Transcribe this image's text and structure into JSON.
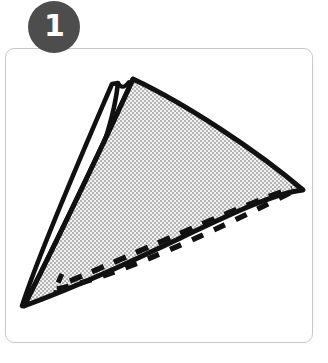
{
  "figure": {
    "kind": "instructional-step-diagram",
    "caption": ""
  },
  "badge": {
    "name": "step-number-badge",
    "number": "1",
    "shape": "circle",
    "fill_color": "#4d4d4d",
    "text_color": "#ffffff"
  },
  "panel": {
    "name": "instruction-panel",
    "background_color": "#ffffff",
    "border_color": "#c9c9c9",
    "corner_radius": 9
  },
  "illustration": {
    "name": "folded-fabric-triangle",
    "outline_color": "#111111",
    "fabric_fill_color": "#cfcfcf",
    "fabric_weave_color": "#bdbdbd",
    "underlayer_color": "#ffffff",
    "stitch_line_color": "#111111",
    "stitch_style": "dashed",
    "elements": [
      {
        "label": "main-fabric-triangle",
        "description": "shaded woven triangle, apex top, long curved top edge to right point"
      },
      {
        "label": "folded-under-flap",
        "description": "narrow white sliver along the left fold edge"
      },
      {
        "label": "top-left-peak",
        "description": "secondary small peak of the under layer at the top"
      },
      {
        "label": "upper-stitch-line",
        "description": "dashed line running from lower-left toward the right point"
      },
      {
        "label": "lower-stitch-line",
        "description": "dashed line following the bottom edge toward the right point"
      },
      {
        "label": "right-point",
        "description": "sharp right corner of the triangle"
      },
      {
        "label": "bottom-point",
        "description": "sharp bottom-left corner of the triangle"
      }
    ]
  }
}
